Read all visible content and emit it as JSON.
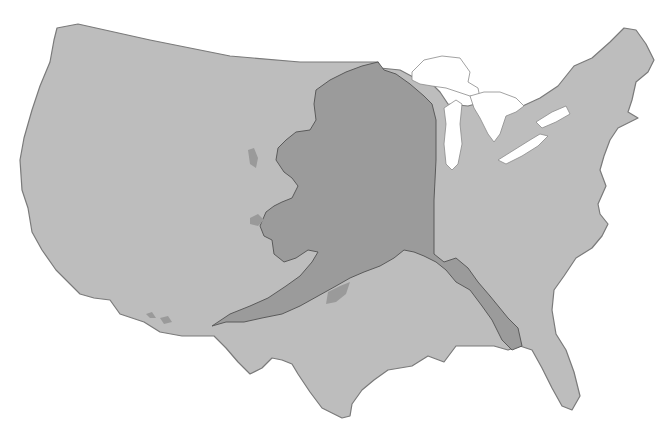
{
  "map": {
    "description": "Alaska overlaid on the contiguous United States for size comparison",
    "colors": {
      "background": "#ffffff",
      "contiguous_us_fill": "#bdbdbd",
      "contiguous_us_stroke": "#7a7a7a",
      "alaska_fill": "#9a9a9a",
      "alaska_overlap_fill": "#8e8e8e",
      "alaska_stroke": "#555555",
      "lakes_fill": "#ffffff",
      "lakes_stroke": "#8a8a8a"
    },
    "layers": [
      {
        "name": "contiguous-us",
        "path": "M57,28 L78,24 L150,40 L230,56 L300,62 L378,62 L380,68 L400,70 L415,78 L428,80 L440,92 L448,104 L468,106 L490,100 L514,110 L540,98 L558,86 L574,66 L592,58 L610,42 L624,28 L636,30 L646,44 L654,60 L648,72 L636,82 L632,100 L628,112 L638,118 L618,128 L610,140 L604,156 L600,170 L606,186 L598,204 L600,214 L608,224 L602,236 L592,248 L576,258 L564,276 L554,290 L552,310 L556,334 L566,350 L574,372 L580,396 L572,410 L562,406 L552,388 L542,368 L532,350 L520,346 L508,350 L494,346 L474,346 L456,346 L444,362 L428,356 L412,366 L388,370 L374,380 L362,390 L352,404 L350,416 L342,418 L322,408 L310,392 L298,374 L292,364 L282,360 L272,358 L262,368 L250,374 L238,362 L226,348 L214,336 L194,336 L182,336 L160,332 L144,322 L120,314 L110,300 L94,298 L80,294 L70,284 L56,270 L42,250 L32,232 L28,208 L22,190 L20,160 L24,138 L32,110 L40,86 L50,62 L54,40 Z"
      },
      {
        "name": "alaska-overlay",
        "path": "M378,62 L384,70 L396,74 L410,84 L424,96 L432,104 L436,120 L436,160 L434,200 L434,254 L444,262 L456,258 L468,268 L478,282 L490,296 L508,318 L518,328 L522,346 L512,350 L502,340 L492,320 L482,306 L470,290 L456,282 L446,270 L436,262 L424,256 L414,252 L404,250 L394,258 L380,266 L364,272 L350,278 L336,286 L318,296 L300,306 L282,314 L262,318 L244,322 L226,322 L212,326 L230,314 L250,306 L268,298 L286,286 L300,276 L312,262 L318,252 L308,250 L296,258 L284,262 L274,254 L272,240 L264,236 L260,226 L266,212 L274,206 L282,202 L292,198 L298,186 L292,178 L284,172 L276,160 L278,148 L286,140 L296,132 L310,130 L316,120 L314,104 L316,90 L330,80 L346,72 L362,66 Z"
      }
    ],
    "lakes": [
      {
        "name": "lake-superior",
        "path": "M412,72 L424,60 L442,56 L460,58 L470,72 L468,82 L478,88 L480,98 L470,96 L458,92 L446,88 L432,86 L420,84 L412,80 Z"
      },
      {
        "name": "lake-michigan",
        "path": "M444,108 L456,100 L462,104 L460,124 L462,144 L458,164 L452,170 L446,164 L444,144 L446,124 Z"
      },
      {
        "name": "lake-huron",
        "path": "M470,96 L484,92 L500,92 L516,98 L524,106 L516,112 L506,116 L500,134 L494,142 L488,134 L484,126 L480,118 L474,108 Z"
      },
      {
        "name": "lake-erie",
        "path": "M498,160 L514,150 L530,140 L540,134 L548,136 L538,146 L522,156 L506,164 Z"
      },
      {
        "name": "lake-ontario",
        "path": "M536,122 L552,112 L566,106 L570,114 L556,122 L542,128 Z"
      }
    ],
    "islands": [
      {
        "name": "alaska-island-west",
        "path": "M248,150 L254,148 L258,158 L256,168 L250,164 Z"
      },
      {
        "name": "alaska-island-kodiak",
        "path": "M328,292 L340,286 L350,282 L346,294 L336,302 L326,304 Z"
      },
      {
        "name": "alaska-island-aleutian-1",
        "path": "M160,318 L168,316 L172,322 L164,324 Z"
      },
      {
        "name": "alaska-island-aleutian-2",
        "path": "M146,314 L152,312 L156,318 L150,318 Z"
      },
      {
        "name": "alaska-island-nunivak",
        "path": "M250,218 L258,214 L264,220 L258,226 L250,224 Z"
      }
    ]
  }
}
